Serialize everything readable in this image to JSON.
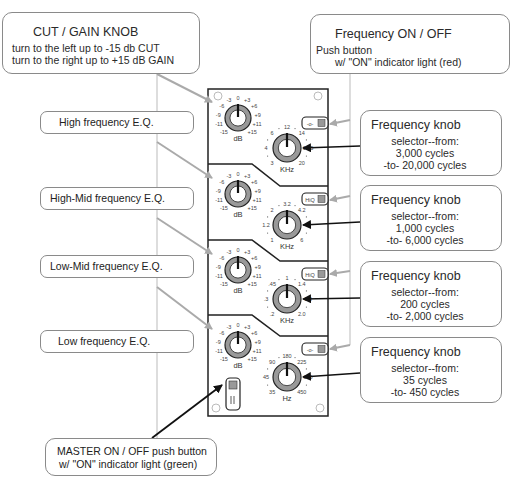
{
  "callouts": {
    "cut_gain": {
      "title": "CUT / GAIN KNOB",
      "line1": "turn to the left up to -15 db CUT",
      "line2": "turn to the right up to +15 dB GAIN"
    },
    "freq_on_off": {
      "title": "Frequency ON / OFF",
      "line1": "Push button",
      "line2": "w/ \"ON\" indicator light (red)"
    },
    "master": {
      "line1": "MASTER ON / OFF    push button",
      "line2": "w/ \"ON\" indicator light (green)"
    }
  },
  "bands": [
    {
      "label": "High frequency E.Q."
    },
    {
      "label": "High-Mid frequency E.Q."
    },
    {
      "label": "Low-Mid frequency E.Q."
    },
    {
      "label": "Low frequency E.Q."
    }
  ],
  "freq_knobs": [
    {
      "title": "Frequency knob",
      "l1": "selector--from:",
      "l2": "3,000 cycles",
      "l3": "-to- 20,000 cycles"
    },
    {
      "title": "Frequency knob",
      "l1": "selector--from:",
      "l2": "1,000 cycles",
      "l3": "-to- 6,000 cycles"
    },
    {
      "title": "Frequency knob",
      "l1": "selector--from:",
      "l2": "200 cycles",
      "l3": "-to- 2,000 cycles"
    },
    {
      "title": "Frequency knob",
      "l1": "selector--from:",
      "l2": "35 cycles",
      "l3": "-to- 450 cycles"
    }
  ],
  "panel": {
    "gain_scale": [
      "-15",
      "-11",
      "-9",
      "-6",
      "-3",
      "0",
      "+3",
      "+6",
      "+9",
      "+11",
      "+15"
    ],
    "gain_unit": "dB",
    "freq_scales": [
      {
        "labels": [
          "3",
          "4",
          "6",
          "12",
          "14",
          "16.5",
          "20"
        ],
        "unit": "KHz"
      },
      {
        "labels": [
          "1",
          "1.2",
          "2",
          "3.2",
          "4.2",
          "5",
          "6"
        ],
        "unit": "KHz"
      },
      {
        "labels": [
          ".2",
          ".3",
          ".45",
          "1",
          "1.4",
          "1.8",
          "2.0"
        ],
        "unit": "KHz"
      },
      {
        "labels": [
          "35",
          "45",
          "90",
          "180",
          "225",
          "300",
          "450"
        ],
        "unit": "Hz"
      }
    ],
    "switch_labels": [
      "-o-",
      "HiQ",
      "HiQ",
      "-o-"
    ]
  },
  "colors": {
    "knob_ring": "#999999",
    "arrow_gray": "#aaaaaa",
    "line_dark": "#222222"
  }
}
